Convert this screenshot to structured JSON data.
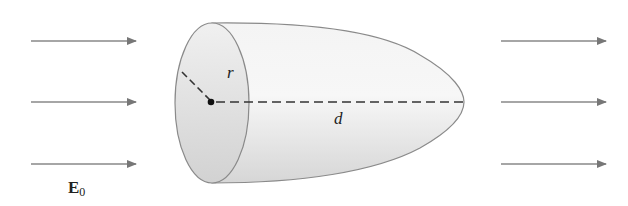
{
  "diagram": {
    "labels": {
      "radius": "r",
      "length": "d",
      "field_main": "E",
      "field_sub": "0"
    },
    "arrows": {
      "left": [
        {
          "y": 41
        },
        {
          "y": 102
        },
        {
          "y": 164
        }
      ],
      "right": [
        {
          "y": 41
        },
        {
          "y": 102
        },
        {
          "y": 164
        }
      ]
    },
    "colors": {
      "arrow": "#777777",
      "body_fill": "#e6e6e6",
      "outline": "#8a8a8a",
      "dashed_line": "#333333"
    }
  }
}
